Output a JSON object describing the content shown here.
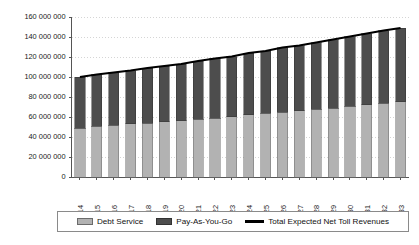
{
  "chart_data": {
    "type": "bar",
    "title": "",
    "subtitle": "",
    "xlabel": "",
    "ylabel": "",
    "grid": true,
    "stacked": true,
    "legend_position": "bottom",
    "ylim": [
      0,
      160000000
    ],
    "ytick_values": [
      0,
      20000000,
      40000000,
      60000000,
      80000000,
      100000000,
      120000000,
      140000000,
      160000000
    ],
    "ytick_labels": [
      "0",
      "20 000 000",
      "40 000 000",
      "60 000 000",
      "80 000 000",
      "100 000 000",
      "120 000 000",
      "140 000 000",
      "160 000 000"
    ],
    "categories": [
      "2014",
      "2015",
      "2016",
      "2017",
      "2018",
      "2019",
      "2020",
      "2021",
      "2022",
      "2023",
      "2024",
      "2025",
      "2026",
      "2027",
      "2028",
      "2029",
      "2030",
      "2031",
      "2032",
      "2033"
    ],
    "series": [
      {
        "name": "Debt Service",
        "kind": "bar",
        "color": "#b2b2b2",
        "values": [
          49000000,
          51000000,
          52000000,
          53500000,
          54000000,
          55500000,
          56500000,
          58000000,
          59000000,
          60500000,
          62500000,
          64000000,
          65000000,
          66500000,
          68000000,
          69000000,
          71000000,
          72500000,
          74000000,
          75500000
        ]
      },
      {
        "name": "Pay-As-You-Go",
        "kind": "bar",
        "color": "#4d4d4d",
        "values": [
          51000000,
          51500000,
          52500000,
          53000000,
          55000000,
          55500000,
          56500000,
          58000000,
          59500000,
          60000000,
          61500000,
          62000000,
          64500000,
          65000000,
          66500000,
          68500000,
          69500000,
          71000000,
          72500000,
          73500000
        ]
      },
      {
        "name": "Total Expected Net Toll Revenues",
        "kind": "line",
        "color": "#000000",
        "values": [
          100000000,
          102500000,
          104500000,
          106500000,
          109000000,
          111000000,
          113000000,
          116000000,
          118500000,
          120500000,
          124000000,
          126000000,
          129500000,
          131500000,
          134500000,
          137500000,
          140500000,
          143500000,
          146500000,
          149000000
        ]
      }
    ]
  },
  "legend": {
    "items": [
      {
        "label": "Debt Service",
        "marker": "swatch-light-gray"
      },
      {
        "label": "Pay-As-You-Go",
        "marker": "swatch-dark-gray"
      },
      {
        "label": "Total Expected Net Toll Revenues",
        "marker": "line-black"
      }
    ]
  }
}
